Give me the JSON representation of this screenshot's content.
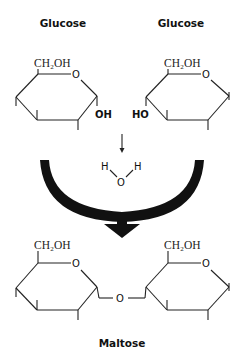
{
  "diagram": {
    "type": "chemical-reaction",
    "reactants": [
      {
        "label": "Glucose",
        "substituent_top": "CH₂OH",
        "ring_oxygen": "O",
        "hydroxyl": "OH"
      },
      {
        "label": "Glucose",
        "substituent_top": "CH₂OH",
        "ring_oxygen": "O",
        "hydroxyl": "HO"
      }
    ],
    "byproduct": {
      "h1": "H",
      "h2": "H",
      "o": "O"
    },
    "product": {
      "label": "Maltose",
      "left_substituent": "CH₂OH",
      "right_substituent": "CH₂OH",
      "left_ring_oxygen": "O",
      "right_ring_oxygen": "O",
      "glycosidic_oxygen": "O"
    },
    "colors": {
      "ink": "#111111",
      "background": "#ffffff"
    }
  }
}
